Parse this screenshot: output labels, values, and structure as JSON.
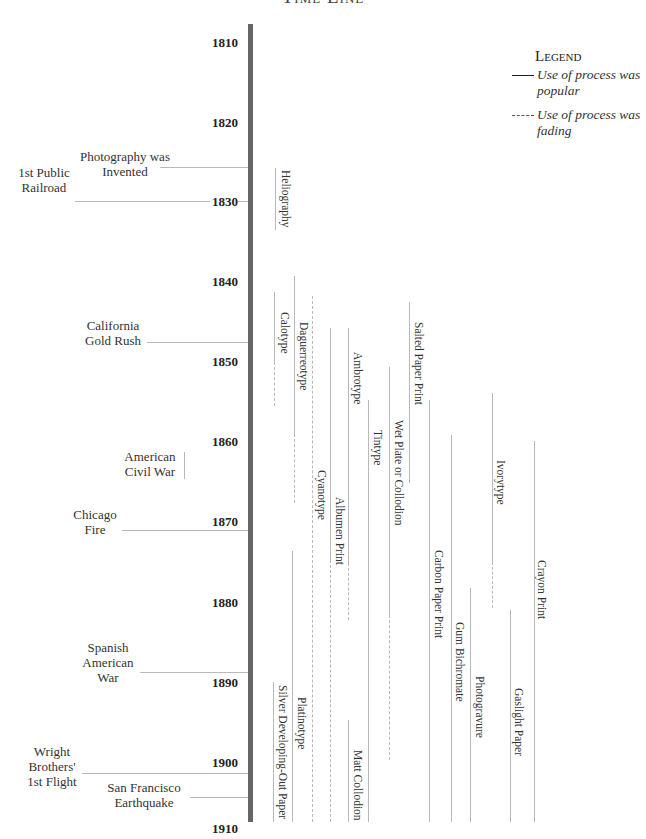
{
  "title": "Time Line",
  "legend": {
    "title": "Legend",
    "items": [
      {
        "style": "solid",
        "label": "Use of process was popular"
      },
      {
        "style": "dashed",
        "label": "Use of process was fading"
      }
    ]
  },
  "axis": {
    "years": [
      "1810",
      "1820",
      "1830",
      "1840",
      "1850",
      "1860",
      "1870",
      "1880",
      "1890",
      "1900",
      "1910"
    ]
  },
  "events": [
    {
      "label": "Photography was Invented",
      "year": 1826
    },
    {
      "label": "1st Public Railroad",
      "year": 1830
    },
    {
      "label": "California Gold Rush",
      "year": 1848
    },
    {
      "label": "American Civil War",
      "year": "1861-1865"
    },
    {
      "label": "Chicago Fire",
      "year": 1871
    },
    {
      "label": "Spanish American War",
      "year": 1898
    },
    {
      "label": "Wright Brothers' 1st Flight",
      "year": 1903
    },
    {
      "label": "San Francisco Earthquake",
      "year": 1906
    }
  ],
  "processes": [
    {
      "name": "Heliography"
    },
    {
      "name": "Calotype"
    },
    {
      "name": "Daguerreotype"
    },
    {
      "name": "Cyanotype"
    },
    {
      "name": "Albumen Print"
    },
    {
      "name": "Ambrotype"
    },
    {
      "name": "Matt Collodion"
    },
    {
      "name": "Tintype"
    },
    {
      "name": "Wet Plate or Collodion"
    },
    {
      "name": "Salted Paper Print"
    },
    {
      "name": "Carbon Paper Print"
    },
    {
      "name": "Gum Bichromate"
    },
    {
      "name": "Photogravure"
    },
    {
      "name": "Ivorytype"
    },
    {
      "name": "Gaslight Paper"
    },
    {
      "name": "Crayon Print"
    },
    {
      "name": "Silver Developing-Out Paper"
    },
    {
      "name": "Platinotype"
    }
  ]
}
